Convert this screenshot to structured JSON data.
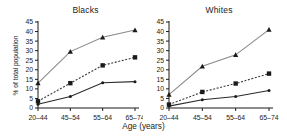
{
  "chart_data": {
    "type": "line",
    "title": "",
    "xlabel": "Age (years)",
    "ylabel": "% of total population",
    "categories": [
      "20–44",
      "45–54",
      "55–64",
      "65–74"
    ],
    "ylim": [
      0,
      45
    ],
    "yticks": [
      0,
      5,
      10,
      15,
      20,
      25,
      30,
      35,
      40,
      45
    ],
    "grid": false,
    "legend": "none",
    "panels": [
      {
        "name": "blacks",
        "title": "Blacks",
        "series": [
          {
            "name": "triangle-series",
            "marker": "triangle",
            "line": "solid",
            "color": "#8a8a8a",
            "values": [
              13.0,
              29.5,
              37.0,
              40.8
            ]
          },
          {
            "name": "square-series",
            "marker": "square",
            "line": "dashed",
            "color": "#3a3a3a",
            "values": [
              3.5,
              13.0,
              22.3,
              26.5
            ]
          },
          {
            "name": "circle-series",
            "marker": "circle",
            "line": "solid",
            "color": "#2a2a2a",
            "values": [
              2.0,
              6.0,
              13.2,
              13.8
            ]
          }
        ]
      },
      {
        "name": "whites",
        "title": "Whites",
        "series": [
          {
            "name": "triangle-series",
            "marker": "triangle",
            "line": "solid",
            "color": "#8a8a8a",
            "values": [
              7.0,
              21.8,
              27.8,
              41.0
            ]
          },
          {
            "name": "square-series",
            "marker": "square",
            "line": "dashed",
            "color": "#3a3a3a",
            "values": [
              1.8,
              8.4,
              12.8,
              18.0
            ]
          },
          {
            "name": "circle-series",
            "marker": "circle",
            "line": "solid",
            "color": "#2a2a2a",
            "values": [
              1.0,
              4.3,
              6.0,
              9.2
            ]
          }
        ]
      }
    ]
  },
  "figure": {
    "xtitle": "Age (years)",
    "ylabel": "% of total population",
    "panel_blacks_title": "Blacks",
    "panel_whites_title": "Whites"
  }
}
